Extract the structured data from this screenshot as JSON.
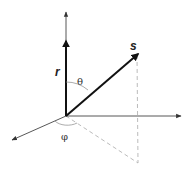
{
  "diagram": {
    "type": "3d-coordinate-vector-diagram",
    "labels": {
      "r": "r",
      "s": "s",
      "theta": "θ",
      "phi": "φ"
    },
    "colors": {
      "axis": "#444444",
      "vector": "#111111",
      "dashed": "#aaaaaa",
      "arc": "#888888"
    },
    "elements": [
      {
        "name": "vertical-axis",
        "description": "axis pointing up"
      },
      {
        "name": "horizontal-axis",
        "description": "axis pointing right"
      },
      {
        "name": "depth-axis",
        "description": "axis pointing lower-left"
      },
      {
        "name": "vector-r",
        "label": "r",
        "description": "bold vector along vertical axis"
      },
      {
        "name": "vector-s",
        "label": "s",
        "description": "bold vector pointing up-right"
      },
      {
        "name": "angle-theta",
        "label": "θ",
        "description": "angle between r and s"
      },
      {
        "name": "angle-phi",
        "label": "φ",
        "description": "azimuthal angle in horizontal plane"
      },
      {
        "name": "projection-lines",
        "description": "dashed projection of s onto horizontal plane"
      }
    ]
  }
}
